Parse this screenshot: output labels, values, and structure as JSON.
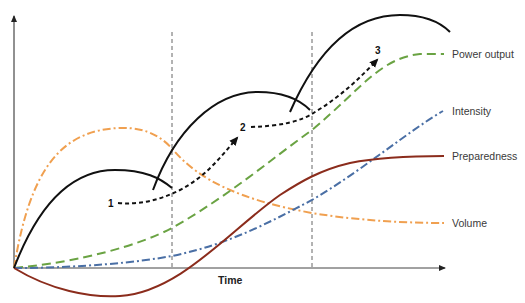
{
  "diagram": {
    "axes": {
      "x_label": "Time",
      "y_label": ""
    },
    "curves": [
      {
        "name": "Power output",
        "style": "dashed",
        "color": "#6aa343"
      },
      {
        "name": "Intensity",
        "style": "dash-dot",
        "color": "#4a6fa5"
      },
      {
        "name": "Preparedness",
        "style": "solid",
        "color": "#8b2c1c"
      },
      {
        "name": "Volume",
        "style": "dash-dot",
        "color": "#f0a050"
      }
    ],
    "fitness_arcs": {
      "count": 3,
      "color": "#111111",
      "style": "solid"
    },
    "progression_markers": [
      {
        "label": "1"
      },
      {
        "label": "2"
      },
      {
        "label": "3"
      }
    ],
    "phase_dividers": {
      "count": 2,
      "style": "dashed",
      "color": "#666666"
    }
  }
}
